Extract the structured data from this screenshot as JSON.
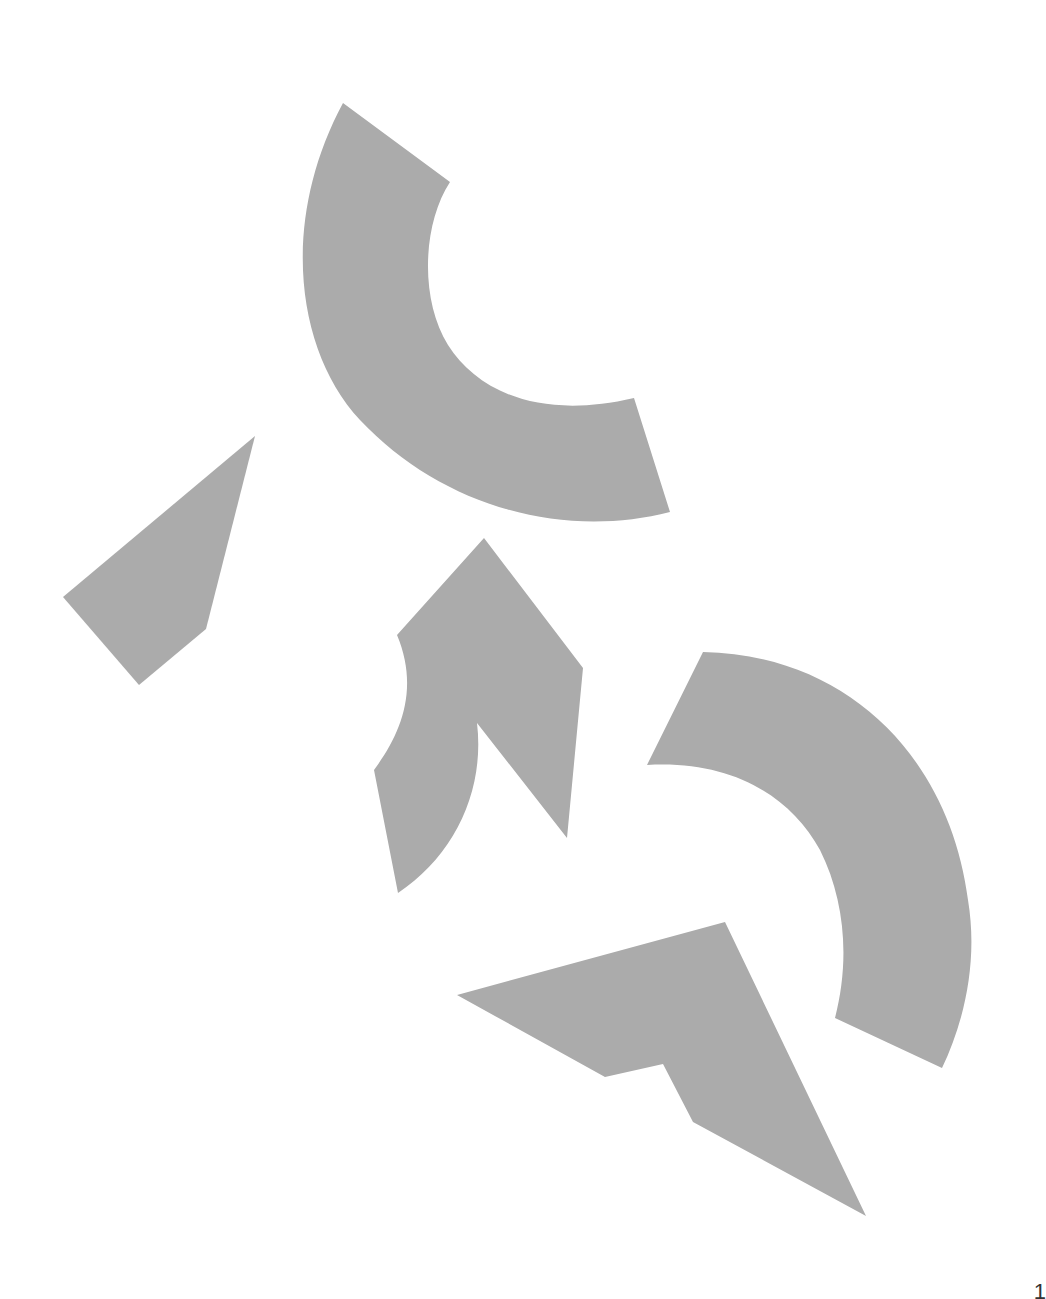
{
  "figure": {
    "fill_color": "#ababab",
    "background_color": "#ffffff",
    "pieces": [
      {
        "id": "top-arc",
        "kind": "curved-band",
        "path": "M343,103 L450,182 C422,225 420,300 448,345 C478,392 540,420 634,398 L670,512 C560,540 440,505 360,420 C295,350 280,220 343,103 Z"
      },
      {
        "id": "left-quad",
        "kind": "polygon",
        "path": "M255,436 L206,629 L139,685 L63,597 Z"
      },
      {
        "id": "middle-piece",
        "kind": "curved-polygon",
        "path": "M484,538 L583,668 L567,838 L477,723 C485,790 455,855 398,893 L374,770 C400,735 420,690 397,635 Z"
      },
      {
        "id": "right-arc",
        "kind": "curved-band",
        "path": "M703,652 C850,655 950,760 968,900 C978,960 965,1020 942,1068 L835,1018 C850,960 845,900 820,850 C790,795 730,760 647,765 Z"
      },
      {
        "id": "bottom-piece",
        "kind": "polygon",
        "path": "M457,995 L725,922 L866,1216 L693,1122 L663,1064 L605,1077 Z"
      }
    ]
  },
  "corner": {
    "page_number_fragment": "1"
  }
}
